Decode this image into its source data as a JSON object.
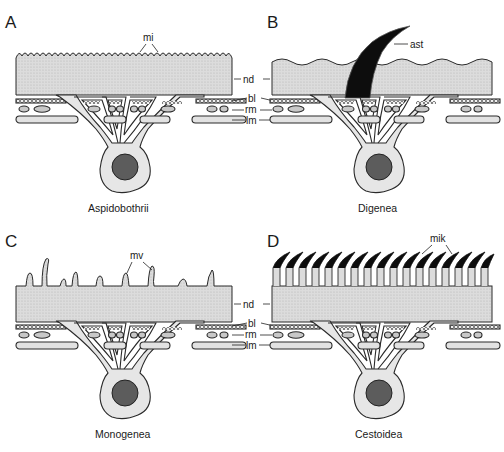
{
  "figure": {
    "colors": {
      "tegument_fill": "#d9d9d9",
      "cell_fill": "#e6e6e6",
      "nucleus_fill": "#5c5c5c",
      "spine_fill": "#0d0d0d",
      "outline": "#2a2a2a",
      "background": "#ffffff"
    },
    "panels": [
      {
        "letter": "A",
        "caption": "Aspidobothrii",
        "surface_label": "mi",
        "surface_type": "microtubercles"
      },
      {
        "letter": "B",
        "caption": "Digenea",
        "surface_label": "ast",
        "surface_type": "spine"
      },
      {
        "letter": "C",
        "caption": "Monogenea",
        "surface_label": "mv",
        "surface_type": "microvilli"
      },
      {
        "letter": "D",
        "caption": "Cestoidea",
        "surface_label": "mik",
        "surface_type": "microtriches"
      }
    ],
    "layer_labels": {
      "nd": "nd",
      "bl": "bl",
      "rm": "rm",
      "lm": "lm"
    }
  }
}
